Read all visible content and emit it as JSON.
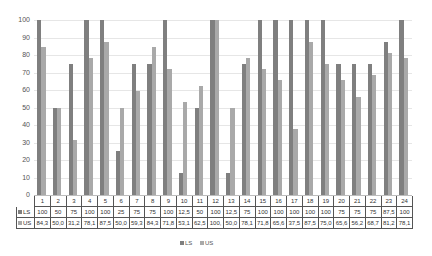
{
  "chart_data": {
    "type": "bar",
    "title": "",
    "xlabel": "",
    "ylabel": "",
    "ylim": [
      0,
      100
    ],
    "yticks": [
      0,
      10,
      20,
      30,
      40,
      50,
      60,
      70,
      80,
      90,
      100
    ],
    "grid": true,
    "legend_position": "bottom",
    "data_table": true,
    "categories": [
      "1",
      "2",
      "3",
      "4",
      "5",
      "6",
      "7",
      "8",
      "9",
      "10",
      "11",
      "12",
      "13",
      "14",
      "15",
      "16",
      "17",
      "18",
      "19",
      "20",
      "21",
      "22",
      "23",
      "24"
    ],
    "series": [
      {
        "name": "LS",
        "color": "#7f7f7f",
        "values": [
          100,
          50,
          75,
          100,
          100,
          25,
          75,
          75,
          100,
          12.5,
          50,
          100,
          12.5,
          75,
          100,
          100,
          100,
          100,
          100,
          75,
          75,
          75,
          87.5,
          100
        ],
        "labels": [
          "100",
          "50",
          "75",
          "100",
          "100",
          "25",
          "75",
          "75",
          "100",
          "12,5",
          "50",
          "100",
          "12,5",
          "75",
          "100",
          "100",
          "100",
          "100",
          "100",
          "75",
          "75",
          "75",
          "87,5",
          "100"
        ]
      },
      {
        "name": "US",
        "color": "#a9a9a9",
        "values": [
          84.3,
          50.0,
          31.2,
          78.1,
          87.5,
          50.0,
          59.3,
          84.3,
          71.8,
          53.1,
          62.5,
          100,
          50.0,
          78.1,
          71.8,
          65.6,
          37.5,
          87.5,
          75.0,
          65.6,
          56.2,
          68.7,
          81.2,
          78.1
        ],
        "labels": [
          "84,3",
          "50,0",
          "31,2",
          "78,1",
          "87,5",
          "50,0",
          "59,3",
          "84,3",
          "71,8",
          "53,1",
          "62,5",
          "100,",
          "50,0",
          "78,1",
          "71,8",
          "65,6",
          "37,5",
          "87,5",
          "75,0",
          "65,6",
          "56,2",
          "68,7",
          "81,2",
          "78,1"
        ]
      }
    ]
  },
  "legend": {
    "items": [
      {
        "label": "LS",
        "color": "#7f7f7f"
      },
      {
        "label": "US",
        "color": "#a9a9a9"
      }
    ]
  }
}
